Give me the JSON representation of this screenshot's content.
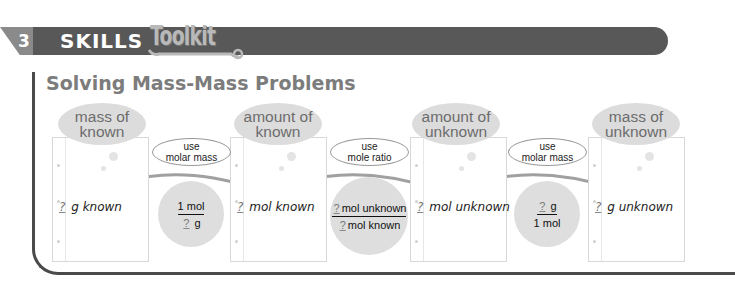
{
  "header": {
    "chapter_number": "3",
    "skills_label": "SKILLS",
    "toolkit_label": "Toolkit",
    "colors": {
      "banner": "#585858",
      "toolkit_text": "#b9b9b9",
      "title": "#7c7c7c"
    }
  },
  "title": "Solving Mass-Mass Problems",
  "steps": [
    {
      "heading_line1": "mass of",
      "heading_line2": "known",
      "blank": "?",
      "value_text": "g known"
    },
    {
      "heading_line1": "amount of",
      "heading_line2": "known",
      "blank": "?",
      "value_text": "mol known"
    },
    {
      "heading_line1": "amount of",
      "heading_line2": "unknown",
      "blank": "?",
      "value_text": "mol unknown"
    },
    {
      "heading_line1": "mass of",
      "heading_line2": "unknown",
      "blank": "?",
      "value_text": "g unknown"
    }
  ],
  "conversions": [
    {
      "label_line1": "use",
      "label_line2": "molar mass",
      "numerator": "1 mol",
      "numerator_blank": "",
      "denominator": "g",
      "denominator_blank": "?"
    },
    {
      "label_line1": "use",
      "label_line2": "mole ratio",
      "numerator": "mol unknown",
      "numerator_blank": "?",
      "denominator": "mol known",
      "denominator_blank": "?"
    },
    {
      "label_line1": "use",
      "label_line2": "molar mass",
      "numerator": "g",
      "numerator_blank": "?",
      "denominator": "1 mol",
      "denominator_blank": ""
    }
  ]
}
